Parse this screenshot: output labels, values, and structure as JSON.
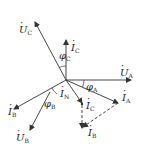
{
  "diagram": {
    "type": "phasor-diagram",
    "origin": [
      66,
      80
    ],
    "colors": {
      "line": "#333333",
      "background": "#ffffff"
    },
    "phasors": [
      {
        "id": "U_A",
        "label": "U",
        "sub": "A",
        "dotted": true,
        "from": [
          66,
          80
        ],
        "to": [
          131,
          80
        ],
        "style": "solid"
      },
      {
        "id": "U_B",
        "label": "U",
        "sub": "B",
        "dotted": true,
        "from": [
          50,
          92
        ],
        "to": [
          30,
          130
        ],
        "style": "solid"
      },
      {
        "id": "U_C",
        "label": "U",
        "sub": "C",
        "dotted": true,
        "from": [
          66,
          80
        ],
        "to": [
          35,
          22
        ],
        "style": "solid"
      },
      {
        "id": "I_A",
        "label": "I",
        "sub": "A",
        "dotted": true,
        "from": [
          66,
          80
        ],
        "to": [
          118,
          103
        ],
        "style": "solid"
      },
      {
        "id": "I_B",
        "label": "I",
        "sub": "B",
        "dotted": true,
        "from": [
          66,
          80
        ],
        "to": [
          14,
          109
        ],
        "style": "solid"
      },
      {
        "id": "I_C",
        "label": "I",
        "sub": "C",
        "dotted": true,
        "from": [
          66,
          80
        ],
        "to": [
          66,
          40
        ],
        "style": "solid"
      },
      {
        "id": "I_N",
        "label": "I",
        "sub": "N",
        "dotted": true,
        "from": [
          66,
          80
        ],
        "to": [
          82,
          103
        ],
        "style": "solid"
      },
      {
        "id": "I_C_shift",
        "label": "I",
        "sub": "C",
        "dotted": true,
        "from": [
          82,
          103
        ],
        "to": [
          82,
          128
        ],
        "style": "dashed"
      },
      {
        "id": "I_B_shift",
        "label": "I",
        "sub": "B",
        "dotted": true,
        "from": [
          118,
          103
        ],
        "to": [
          82,
          128
        ],
        "style": "dashed"
      }
    ],
    "angles": [
      {
        "label": "φ",
        "sub": "A"
      },
      {
        "label": "φ",
        "sub": "B"
      },
      {
        "label": "φ",
        "sub": "C"
      }
    ]
  }
}
